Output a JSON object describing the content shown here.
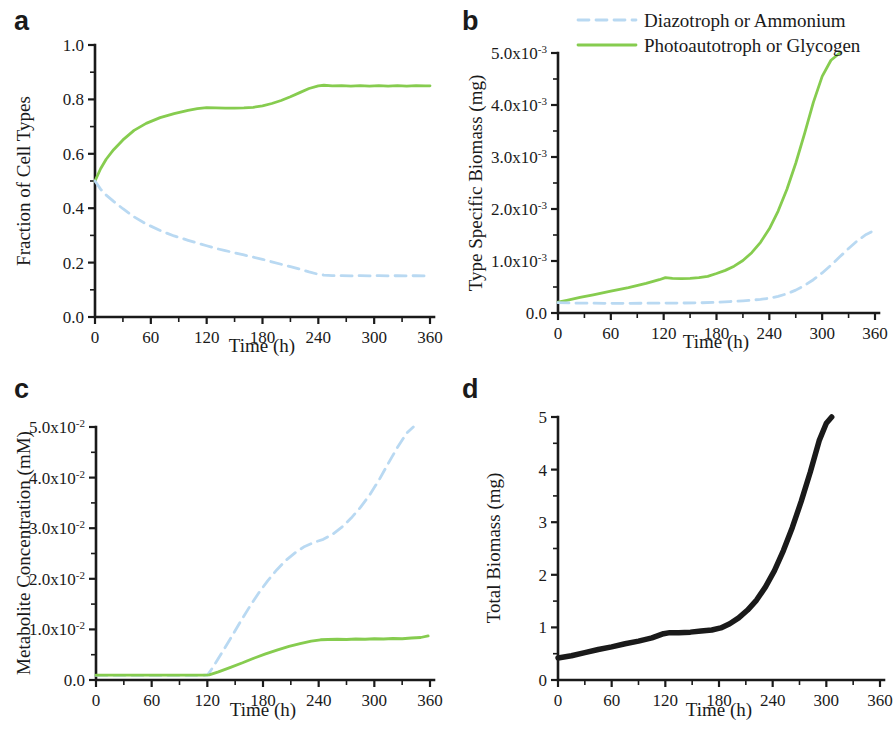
{
  "figure": {
    "panel_labels": {
      "a": "a",
      "b": "b",
      "c": "c",
      "d": "d"
    },
    "xlabel": "Time (h)",
    "colors": {
      "diazotroph": "#b9d9f2",
      "photoautotroph": "#86cc4f",
      "total_biomass": "#1a1a1a",
      "axis": "#1a1a1a",
      "background": "#ffffff"
    },
    "legend": {
      "position": "top-right",
      "entries": [
        {
          "label": "Diazotroph or Ammonium",
          "color": "#b9d9f2",
          "style": "dashed"
        },
        {
          "label": "Photoautotroph or Glycogen",
          "color": "#86cc4f",
          "style": "solid"
        }
      ]
    }
  },
  "chart_data": [
    {
      "id": "panel-a",
      "type": "line",
      "panel": "a",
      "title": "",
      "xlabel": "Time (h)",
      "ylabel": "Fraction of Cell Types",
      "xlim": [
        0,
        360
      ],
      "ylim": [
        0.0,
        1.0
      ],
      "xticks": [
        0,
        60,
        120,
        180,
        240,
        300,
        360
      ],
      "xtick_labels": [
        "0",
        "60",
        "120",
        "180",
        "240",
        "300",
        "360"
      ],
      "yticks": [
        0.0,
        0.2,
        0.4,
        0.6,
        0.8,
        1.0
      ],
      "ytick_labels": [
        "0.0",
        "0.2",
        "0.4",
        "0.6",
        "0.8",
        "1.0"
      ],
      "grid": false,
      "series": [
        {
          "name": "Photoautotroph or Glycogen",
          "color": "#86cc4f",
          "style": "solid",
          "x": [
            0,
            6,
            12,
            20,
            30,
            42,
            55,
            70,
            85,
            100,
            110,
            120,
            130,
            140,
            150,
            160,
            170,
            180,
            190,
            200,
            210,
            220,
            230,
            240,
            246,
            255,
            265,
            275,
            285,
            295,
            305,
            315,
            325,
            335,
            345,
            355,
            360
          ],
          "y": [
            0.5,
            0.545,
            0.58,
            0.615,
            0.651,
            0.686,
            0.712,
            0.733,
            0.748,
            0.76,
            0.766,
            0.77,
            0.769,
            0.768,
            0.768,
            0.769,
            0.771,
            0.776,
            0.785,
            0.796,
            0.81,
            0.825,
            0.84,
            0.85,
            0.852,
            0.85,
            0.851,
            0.849,
            0.851,
            0.849,
            0.851,
            0.849,
            0.851,
            0.849,
            0.851,
            0.85,
            0.85
          ]
        },
        {
          "name": "Diazotroph or Ammonium",
          "color": "#b9d9f2",
          "style": "dashed",
          "x": [
            0,
            6,
            12,
            20,
            30,
            42,
            55,
            70,
            85,
            100,
            110,
            120,
            130,
            140,
            150,
            160,
            170,
            180,
            190,
            200,
            210,
            220,
            230,
            240,
            246,
            255,
            265,
            275,
            285,
            295,
            305,
            315,
            325,
            335,
            345,
            355,
            360
          ],
          "y": [
            0.5,
            0.47,
            0.448,
            0.425,
            0.398,
            0.368,
            0.342,
            0.318,
            0.298,
            0.282,
            0.272,
            0.262,
            0.252,
            0.244,
            0.236,
            0.228,
            0.22,
            0.212,
            0.203,
            0.194,
            0.185,
            0.176,
            0.166,
            0.157,
            0.154,
            0.152,
            0.152,
            0.151,
            0.152,
            0.151,
            0.152,
            0.151,
            0.152,
            0.151,
            0.152,
            0.151,
            0.151
          ]
        }
      ]
    },
    {
      "id": "panel-b",
      "type": "line",
      "panel": "b",
      "title": "",
      "xlabel": "Time (h)",
      "ylabel": "Type Specific Biomass (mg)",
      "xlim": [
        0,
        360
      ],
      "ylim": [
        0.0,
        0.005
      ],
      "xticks": [
        0,
        60,
        120,
        180,
        240,
        300,
        360
      ],
      "xtick_labels": [
        "0",
        "60",
        "120",
        "180",
        "240",
        "300",
        "360"
      ],
      "yticks": [
        0.0,
        0.001,
        0.002,
        0.003,
        0.004,
        0.005
      ],
      "ytick_labels": [
        "0.0",
        "1.0x10",
        "2.0x10",
        "3.0x10",
        "4.0x10",
        "5.0x10"
      ],
      "ytick_exponents": [
        "",
        "-3",
        "-3",
        "-3",
        "-3",
        "-3"
      ],
      "grid": false,
      "series": [
        {
          "name": "Photoautotroph or Glycogen",
          "color": "#86cc4f",
          "style": "solid",
          "x": [
            0,
            10,
            25,
            40,
            60,
            80,
            100,
            115,
            122,
            130,
            140,
            150,
            160,
            170,
            180,
            190,
            200,
            210,
            220,
            230,
            240,
            250,
            260,
            270,
            280,
            290,
            300,
            310,
            320
          ],
          "y": [
            0.00021,
            0.000245,
            0.0003,
            0.00035,
            0.00042,
            0.00049,
            0.00057,
            0.00064,
            0.00068,
            0.000665,
            0.00066,
            0.000665,
            0.00068,
            0.000705,
            0.00076,
            0.00082,
            0.0009,
            0.00101,
            0.00116,
            0.00136,
            0.00162,
            0.00196,
            0.00238,
            0.00288,
            0.00345,
            0.00405,
            0.00455,
            0.00486,
            0.005
          ]
        },
        {
          "name": "Diazotroph or Ammonium",
          "color": "#b9d9f2",
          "style": "dashed",
          "x": [
            0,
            20,
            40,
            60,
            80,
            100,
            120,
            140,
            160,
            180,
            195,
            210,
            220,
            230,
            240,
            250,
            260,
            270,
            280,
            290,
            300,
            310,
            320,
            330,
            340,
            350,
            357
          ],
          "y": [
            0.0002,
            0.00019,
            0.000188,
            0.000186,
            0.000186,
            0.000188,
            0.00019,
            0.000192,
            0.000196,
            0.000205,
            0.00022,
            0.000235,
            0.000248,
            0.000262,
            0.000285,
            0.00032,
            0.00037,
            0.00044,
            0.00053,
            0.00064,
            0.00077,
            0.00092,
            0.00108,
            0.00124,
            0.00139,
            0.00151,
            0.00157
          ]
        }
      ]
    },
    {
      "id": "panel-c",
      "type": "line",
      "panel": "c",
      "title": "",
      "xlabel": "Time (h)",
      "ylabel": "Metabolite Concentration (mM)",
      "xlim": [
        0,
        360
      ],
      "ylim": [
        0.0,
        0.05
      ],
      "xticks": [
        0,
        60,
        120,
        180,
        240,
        300,
        360
      ],
      "xtick_labels": [
        "0",
        "60",
        "120",
        "180",
        "240",
        "300",
        "360"
      ],
      "yticks": [
        0.0,
        0.01,
        0.02,
        0.03,
        0.04,
        0.05
      ],
      "ytick_labels": [
        "0.0",
        "1.0x10",
        "2.0x10",
        "3.0x10",
        "4.0x10",
        "5.0x10"
      ],
      "ytick_exponents": [
        "",
        "-2",
        "-2",
        "-2",
        "-2",
        "-2"
      ],
      "grid": false,
      "series": [
        {
          "name": "Diazotroph or Ammonium",
          "color": "#b9d9f2",
          "style": "dashed",
          "x": [
            0,
            60,
            100,
            120,
            126,
            135,
            145,
            155,
            165,
            175,
            185,
            195,
            205,
            215,
            225,
            235,
            245,
            255,
            265,
            275,
            285,
            295,
            305,
            315,
            325,
            335,
            342
          ],
          "y": [
            0.0009,
            0.0009,
            0.0009,
            0.00095,
            0.0025,
            0.0052,
            0.0082,
            0.0113,
            0.0143,
            0.0171,
            0.0196,
            0.0218,
            0.0237,
            0.0252,
            0.0264,
            0.0272,
            0.0278,
            0.0288,
            0.0302,
            0.032,
            0.0341,
            0.0366,
            0.0395,
            0.0428,
            0.046,
            0.0488,
            0.05
          ]
        },
        {
          "name": "Photoautotroph or Glycogen",
          "color": "#86cc4f",
          "style": "solid",
          "x": [
            0,
            30,
            60,
            90,
            115,
            122,
            132,
            145,
            158,
            170,
            182,
            195,
            208,
            220,
            232,
            242,
            250,
            260,
            270,
            280,
            290,
            300,
            310,
            320,
            330,
            340,
            350,
            358
          ],
          "y": [
            0.00095,
            0.00095,
            0.00095,
            0.00095,
            0.00095,
            0.001,
            0.0016,
            0.0025,
            0.0034,
            0.0043,
            0.0051,
            0.0059,
            0.00665,
            0.0072,
            0.0077,
            0.00795,
            0.008,
            0.00805,
            0.008,
            0.0081,
            0.00805,
            0.00815,
            0.0081,
            0.0082,
            0.00815,
            0.0083,
            0.0084,
            0.0087
          ]
        }
      ]
    },
    {
      "id": "panel-d",
      "type": "line",
      "panel": "d",
      "title": "",
      "xlabel": "Time (h)",
      "ylabel": "Total Biomass (mg)",
      "xlim": [
        0,
        360
      ],
      "ylim": [
        0,
        5
      ],
      "xticks": [
        0,
        60,
        120,
        180,
        240,
        300,
        360
      ],
      "xtick_labels": [
        "0",
        "60",
        "120",
        "180",
        "240",
        "300",
        "360"
      ],
      "yticks": [
        0,
        1,
        2,
        3,
        4,
        5
      ],
      "ytick_labels": [
        "0",
        "1",
        "2",
        "3",
        "4",
        "5"
      ],
      "grid": false,
      "series": [
        {
          "name": "Total Biomass",
          "color": "#1a1a1a",
          "style": "solid",
          "x": [
            0,
            15,
            30,
            45,
            60,
            75,
            90,
            105,
            118,
            125,
            135,
            148,
            160,
            172,
            182,
            192,
            202,
            212,
            222,
            232,
            242,
            252,
            262,
            272,
            282,
            292,
            300,
            306
          ],
          "y": [
            0.42,
            0.46,
            0.52,
            0.58,
            0.63,
            0.69,
            0.74,
            0.8,
            0.88,
            0.9,
            0.9,
            0.91,
            0.93,
            0.95,
            0.99,
            1.07,
            1.18,
            1.33,
            1.52,
            1.77,
            2.08,
            2.46,
            2.9,
            3.4,
            3.95,
            4.55,
            4.88,
            5.0
          ]
        }
      ]
    }
  ]
}
